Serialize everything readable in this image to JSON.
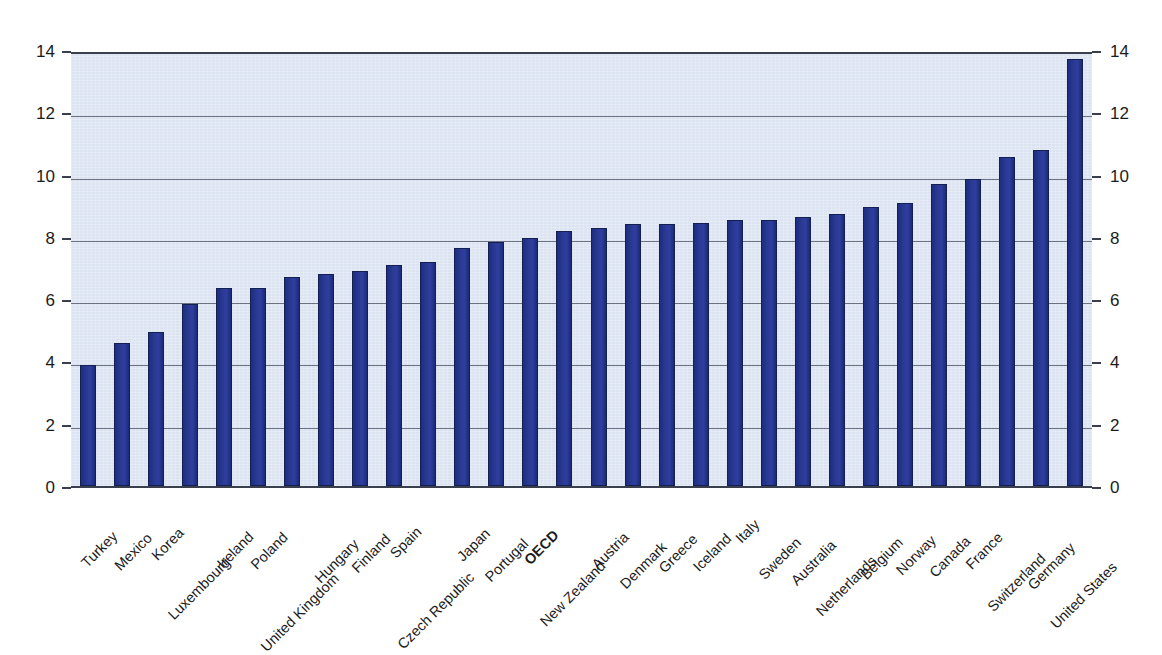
{
  "chart_data": {
    "type": "bar",
    "title": "",
    "subtitle": "",
    "xlabel": "",
    "ylabel": "",
    "ylim": [
      0,
      14
    ],
    "ytick_step": 2,
    "yticks": [
      "0",
      "2",
      "4",
      "6",
      "8",
      "10",
      "12",
      "14"
    ],
    "grid": true,
    "grid_axis": "y",
    "legend": "none",
    "dual_axis": true,
    "left_axis_ticks": [
      "0",
      "2",
      "4",
      "6",
      "8",
      "10",
      "12",
      "14"
    ],
    "right_axis_ticks": [
      "0",
      "2",
      "4",
      "6",
      "8",
      "10",
      "12",
      "14"
    ],
    "sorted": "ascending",
    "highlight_category": "OECD",
    "categories": [
      "Turkey",
      "Mexico",
      "Korea",
      "Luxembourg",
      "Ireland",
      "Poland",
      "United Kingdom",
      "Hungary",
      "Finland",
      "Spain",
      "Czech Republic",
      "Japan",
      "Portugal",
      "OECD",
      "New Zealand",
      "Austria",
      "Denmark",
      "Greece",
      "Iceland",
      "Italy",
      "Sweden",
      "Australia",
      "Netherlands",
      "Belgium",
      "Norway",
      "Canada",
      "France",
      "Switzerland",
      "Germany",
      "United States"
    ],
    "values": [
      3.9,
      4.6,
      4.95,
      5.85,
      6.35,
      6.35,
      6.7,
      6.8,
      6.9,
      7.1,
      7.2,
      7.65,
      7.85,
      7.95,
      8.2,
      8.3,
      8.4,
      8.4,
      8.45,
      8.55,
      8.55,
      8.65,
      8.75,
      8.95,
      9.1,
      9.7,
      9.85,
      10.55,
      10.8,
      13.7
    ],
    "bold_categories": [
      "OECD"
    ],
    "colors": {
      "bar_fill": "#2a3a93",
      "bar_edge": "#141f52",
      "plot_background": "#dde4f1",
      "gridline": "#6b7180",
      "axis_line": "#3a3f4d",
      "text": "#1b1b1b",
      "page_background": "#ffffff"
    }
  }
}
